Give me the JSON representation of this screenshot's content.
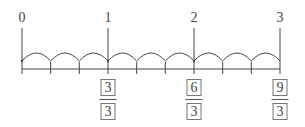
{
  "number_line": {
    "labels": [
      "0",
      "1",
      "2",
      "3"
    ],
    "label_x": [
      22,
      108,
      194,
      280
    ],
    "subdivisions_per_unit": 3,
    "jumps": 9
  },
  "fractions": [
    {
      "numerator": "3",
      "denominator": "3",
      "x": 108
    },
    {
      "numerator": "6",
      "denominator": "3",
      "x": 194
    },
    {
      "numerator": "9",
      "denominator": "3",
      "x": 280
    }
  ],
  "colors": {
    "line": "#444444",
    "box_border": "#777777"
  }
}
